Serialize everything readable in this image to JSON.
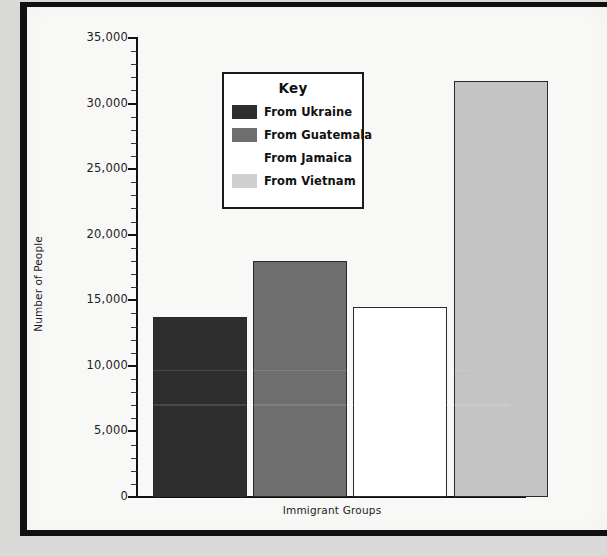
{
  "chart_data": {
    "type": "bar",
    "title": "",
    "xlabel": "Immigrant Groups",
    "ylabel": "Number of People",
    "ylim": [
      0,
      35000
    ],
    "ytick_step": 5000,
    "yminor_step": 1000,
    "grid": false,
    "legend_position": "inside-upper-center",
    "legend_title": "Key",
    "categories": [
      "From Ukraine",
      "From Guatemala",
      "From Jamaica",
      "From Vietnam"
    ],
    "values": [
      13700,
      18000,
      14500,
      31700
    ],
    "ytick_labels": [
      "0",
      "5,000",
      "10,000",
      "15,000",
      "20,000",
      "25,000",
      "30,000",
      "35,000"
    ],
    "bar_colors": [
      "#2e2e2e",
      "#6e6e6e",
      "#ffffff",
      "#c4c4c4"
    ],
    "bar_edge_color": "#2a2a2a"
  },
  "chart": {
    "y_axis_title": "Number of People",
    "x_axis_title": "Immigrant Groups",
    "y_ticks": [
      {
        "label": "35,000",
        "value": 35000
      },
      {
        "label": "30,000",
        "value": 30000
      },
      {
        "label": "25,000",
        "value": 25000
      },
      {
        "label": "20,000",
        "value": 20000
      },
      {
        "label": "15,000",
        "value": 15000
      },
      {
        "label": "10,000",
        "value": 10000
      },
      {
        "label": "5,000",
        "value": 5000
      },
      {
        "label": "0",
        "value": 0
      }
    ],
    "bars": [
      {
        "label": "From Ukraine",
        "value": 13700,
        "color": "#2e2e2e"
      },
      {
        "label": "From Guatemala",
        "value": 18000,
        "color": "#6e6e6e"
      },
      {
        "label": "From Jamaica",
        "value": 14500,
        "color": "#ffffff"
      },
      {
        "label": "From Vietnam",
        "value": 31700,
        "color": "#c4c4c4"
      }
    ]
  },
  "legend": {
    "title": "Key",
    "items": [
      {
        "label": "From Ukraine",
        "color": "#2e2e2e"
      },
      {
        "label": "From Guatemala",
        "color": "#6e6e6e"
      },
      {
        "label": "From Jamaica",
        "color": "#ffffff"
      },
      {
        "label": "From Vietnam",
        "color": "#cfcfcf"
      }
    ]
  }
}
